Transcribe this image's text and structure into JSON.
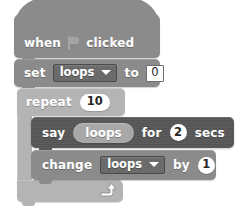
{
  "script": {
    "title": "scratch-script",
    "blocks": [
      {
        "id": "hat",
        "type": "hat",
        "kind": "event",
        "color": "#8b8b8b",
        "label_before": "when",
        "icon": "green-flag-icon",
        "label_after": "clicked"
      },
      {
        "id": "set-variable",
        "type": "stack",
        "kind": "data",
        "color": "#8b8b8b",
        "label": "set",
        "variable": "loops",
        "connector": "to",
        "value": "0"
      },
      {
        "id": "repeat",
        "type": "c-block",
        "kind": "control",
        "color": "#b4b4b4",
        "label": "repeat",
        "times": "10",
        "loop_icon": "loop-arrow-icon"
      },
      {
        "id": "say-for-secs",
        "type": "stack",
        "kind": "looks",
        "color": "#575757",
        "label": "say",
        "reporter": "loops",
        "connector": "for",
        "duration": "2",
        "unit": "secs"
      },
      {
        "id": "change-variable",
        "type": "stack",
        "kind": "data",
        "color": "#8b8b8b",
        "label": "change",
        "variable": "loops",
        "connector": "by",
        "amount": "1"
      }
    ]
  },
  "colors": {
    "background": "#ffffff",
    "event_block": "#8b8b8b",
    "data_block": "#8b8b8b",
    "control_block": "#b4b4b4",
    "looks_block": "#575757",
    "reporter": "#a8a8a8",
    "field_text": "#262626",
    "block_text": "#ffffff"
  }
}
